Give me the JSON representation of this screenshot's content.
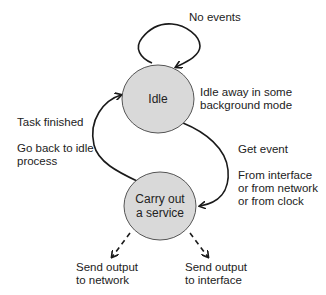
{
  "diagram": {
    "type": "state-diagram",
    "colors": {
      "node_fill": "#d9d9d9",
      "node_stroke": "#555555",
      "edge": "#1a1a1a"
    },
    "nodes": [
      {
        "id": "idle",
        "label": "Idle"
      },
      {
        "id": "service",
        "label_line1": "Carry out",
        "label_line2": "a service"
      }
    ],
    "annotations": {
      "self_loop": "No events",
      "idle_desc_line1": "Idle away in some",
      "idle_desc_line2": "background mode",
      "task_finished": "Task finished",
      "go_back_line1": "Go back to idle",
      "go_back_line2": "process",
      "get_event": "Get event",
      "from_line1": "From interface",
      "from_line2": "or from network",
      "from_line3": "or from clock",
      "out_net_line1": "Send output",
      "out_net_line2": "to network",
      "out_if_line1": "Send output",
      "out_if_line2": "to interface"
    },
    "edges": [
      {
        "from": "idle",
        "to": "idle",
        "label": "No events",
        "style": "solid"
      },
      {
        "from": "idle",
        "to": "service",
        "label": "Get event",
        "style": "solid"
      },
      {
        "from": "service",
        "to": "idle",
        "label": "Task finished",
        "style": "solid"
      },
      {
        "from": "service",
        "to": "network",
        "label": "Send output to network",
        "style": "dashed"
      },
      {
        "from": "service",
        "to": "interface",
        "label": "Send output to interface",
        "style": "dashed"
      }
    ]
  }
}
